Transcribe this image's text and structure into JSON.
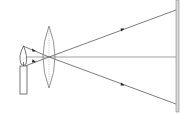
{
  "diagram": {
    "colors": {
      "background": "#ffffff",
      "ray": "#444444",
      "axis": "#888888",
      "lens_outline": "#777777",
      "lens_dashed_center": "#aaaaaa",
      "candle": "#555555",
      "screen_fill": "#d8d8d8",
      "screen_edge": "#888888"
    },
    "elements": {
      "candle": {
        "body": {
          "x": 20,
          "y": 66,
          "w": 7,
          "h": 28
        },
        "flame_tip": {
          "x": 23,
          "y": 46
        }
      },
      "lens": {
        "cx": 49,
        "cy": 57,
        "half_width": 6,
        "half_height": 31
      },
      "screen": {
        "x": 176,
        "y": 0,
        "w": 3,
        "h": 112
      },
      "rays": [
        {
          "name": "upper-ray",
          "from": [
            23,
            46
          ],
          "via": [
            49,
            57
          ],
          "to": [
            176,
            104
          ],
          "arrow_at": [
            123,
            84
          ]
        },
        {
          "name": "lower-ray",
          "from": [
            25,
            66
          ],
          "via": [
            49,
            57
          ],
          "to": [
            176,
            10
          ],
          "arrow_at": [
            123,
            29
          ]
        },
        {
          "name": "principal-axis",
          "from": [
            25,
            57
          ],
          "to": [
            176,
            57
          ]
        }
      ],
      "pre-lens-arrows": [
        [
          34,
          50
        ],
        [
          34,
          63
        ]
      ]
    }
  }
}
